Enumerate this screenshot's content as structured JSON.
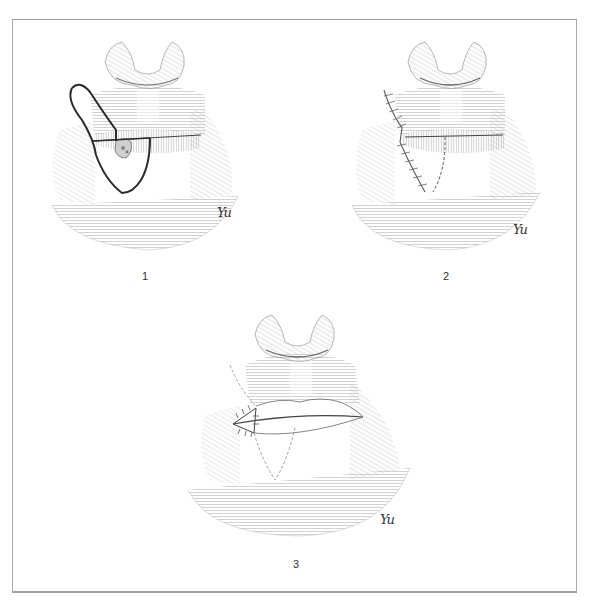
{
  "figure": {
    "panels": [
      {
        "id": 1,
        "label": "1",
        "signature": "Yu",
        "description": "Lower lip lesion with outlined flap incision from upper lip/cheek"
      },
      {
        "id": 2,
        "label": "2",
        "signature": "Yu",
        "description": "Flap rotated and sutured into lower lip defect"
      },
      {
        "id": 3,
        "label": "3",
        "signature": "Yu",
        "description": "Commissure reconstruction with sutured oral commissure"
      }
    ],
    "colors": {
      "frame": "#a9a9a9",
      "hatching": "#9a9a9a",
      "incision": "#2a2a2a",
      "suture": "#555555"
    }
  }
}
